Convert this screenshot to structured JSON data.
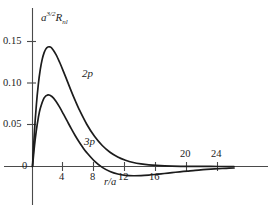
{
  "figure": {
    "y_axis_label_base": "a",
    "y_axis_label_exponent": "3/2",
    "y_axis_label_symbol": "R",
    "y_axis_label_subscript": "nl",
    "x_axis_label": "r/a",
    "curve_label_2p": "2p",
    "curve_label_3p": "3p",
    "axis_color": "#4a4a4a",
    "curve_color": "#1c1c1c",
    "background_color": "#ffffff"
  },
  "chart_data": {
    "type": "line",
    "title": "",
    "subtitle": "",
    "xlabel": "r/a",
    "ylabel": "a^{3/2} R_nl",
    "xlim": [
      0,
      26
    ],
    "ylim": [
      -0.045,
      0.17
    ],
    "grid": false,
    "legend_position": "inline-curve-labels",
    "xticks": [
      4,
      8,
      12,
      16,
      20,
      24
    ],
    "xtick_labels": [
      "4",
      "8",
      "12",
      "16",
      "20",
      "24"
    ],
    "yticks": [
      0,
      0.05,
      0.1,
      0.15
    ],
    "ytick_labels": [
      "0",
      "0.05",
      "0.10",
      "0.15"
    ],
    "annotations": [
      {
        "text": "2p",
        "x": 6.0,
        "y": 0.107
      },
      {
        "text": "3p",
        "x": 6.8,
        "y": 0.029
      }
    ],
    "series": [
      {
        "name": "2p",
        "x": [
          0,
          0.25,
          0.5,
          0.75,
          1,
          1.25,
          1.5,
          1.75,
          2,
          2.25,
          2.5,
          3,
          3.5,
          4,
          4.5,
          5,
          5.5,
          6,
          7,
          8,
          9,
          10,
          11,
          12,
          13,
          14,
          15,
          16,
          18,
          20,
          22,
          24,
          26
        ],
        "y": [
          0,
          0.0467,
          0.0827,
          0.1098,
          0.1296,
          0.1434,
          0.1525,
          0.1578,
          0.1601,
          0.1601,
          0.1583,
          0.1505,
          0.1396,
          0.1271,
          0.114,
          0.1009,
          0.0885,
          0.0769,
          0.0566,
          0.0404,
          0.0281,
          0.0191,
          0.0128,
          0.0084,
          0.0054,
          0.0035,
          0.0022,
          0.0014,
          0.0005,
          0.0002,
          0.0001,
          0.0,
          0.0
        ]
      },
      {
        "name": "3p",
        "x": [
          0,
          0.25,
          0.5,
          0.75,
          1,
          1.5,
          2,
          2.5,
          3,
          3.5,
          4,
          4.5,
          5,
          5.5,
          6,
          6.5,
          7,
          8,
          9,
          10,
          11,
          12,
          13,
          14,
          15,
          16,
          17,
          18,
          19,
          20,
          21,
          22,
          23,
          24,
          25,
          26
        ],
        "y": [
          0,
          0.0272,
          0.0486,
          0.0651,
          0.0775,
          0.0918,
          0.0959,
          0.0937,
          0.0877,
          0.0794,
          0.07,
          0.0603,
          0.0507,
          0.0415,
          0.0331,
          0.0254,
          0.0186,
          0.0071,
          -0.0012,
          -0.0067,
          -0.0101,
          -0.0118,
          -0.0124,
          -0.0122,
          -0.0115,
          -0.0105,
          -0.0094,
          -0.0082,
          -0.0071,
          -0.0061,
          -0.0051,
          -0.0043,
          -0.0036,
          -0.003,
          -0.0024,
          -0.002
        ]
      }
    ]
  }
}
